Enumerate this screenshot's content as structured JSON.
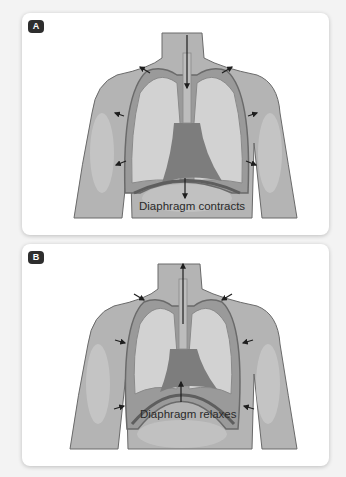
{
  "panels": [
    {
      "label": "A",
      "caption": "Diaphragm contracts",
      "phase": "inhalation",
      "trachea_arrow": "down",
      "diaphragm_arrow": "down",
      "ribcage_arrows": "outward"
    },
    {
      "label": "B",
      "caption": "Diaphragm relaxes",
      "phase": "exhalation",
      "trachea_arrow": "up",
      "diaphragm_arrow": "up",
      "ribcage_arrows": "inward"
    }
  ],
  "colors": {
    "background": "#f3f3f3",
    "card": "#ffffff",
    "skin": "#b4b4b4",
    "skin_light": "#c8c8c8",
    "lung": "#d2d2d2",
    "heart": "#7d7d7d",
    "outline": "#6a6a6a",
    "arrow": "#1e1e1e",
    "badge": "#2e2e2e"
  }
}
